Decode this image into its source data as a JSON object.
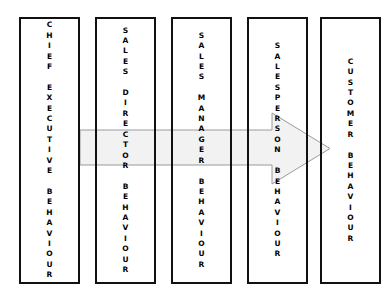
{
  "diagram": {
    "type": "linear-flow",
    "background_color": "#ffffff",
    "box_border_color": "#111111",
    "arrow_fill_color": "#f2f2f2",
    "arrow_stroke_color": "#9a9a9a",
    "boxes": [
      {
        "id": "chief-executive",
        "label": "C\nH\nI\nE\nF\n\nE\nX\nE\nC\nU\nT\nI\nV\nE\n\nB\nE\nH\nA\nV\nI\nO\nU\nR",
        "plain_text": "CHIEF EXECUTIVE BEHAVIOUR"
      },
      {
        "id": "sales-director",
        "label": "S\nA\nL\nE\nS\n\nD\nI\nR\nE\nC\nT\nO\nR\n\nB\nE\nH\nA\nV\nI\nO\nU\nR",
        "plain_text": "SALES DIRECTOR BEHAVIOUR"
      },
      {
        "id": "sales-manager",
        "label": "S\nA\nL\nE\nS\n\nM\nA\nN\nA\nG\nE\nR\n\nB\nE\nH\nA\nV\nI\nO\nU\nR",
        "plain_text": "SALES MANAGER BEHAVIOUR"
      },
      {
        "id": "salesperson",
        "label": "S\nA\nL\nE\nS\nP\nE\nR\nS\nO\nN\n\nB\nE\nH\nA\nV\nI\nO\nU\nR",
        "plain_text": "SALESPERSON BEHAVIOUR"
      },
      {
        "id": "customer",
        "label": "C\nU\nS\nT\nO\nM\nE\nR\n\nB\nE\nH\nA\nV\nI\nO\nU\nR",
        "plain_text": "CUSTOMER BEHAVIOUR"
      }
    ],
    "arrow": {
      "direction": "left-to-right",
      "from": "chief-executive",
      "to": "customer"
    }
  }
}
